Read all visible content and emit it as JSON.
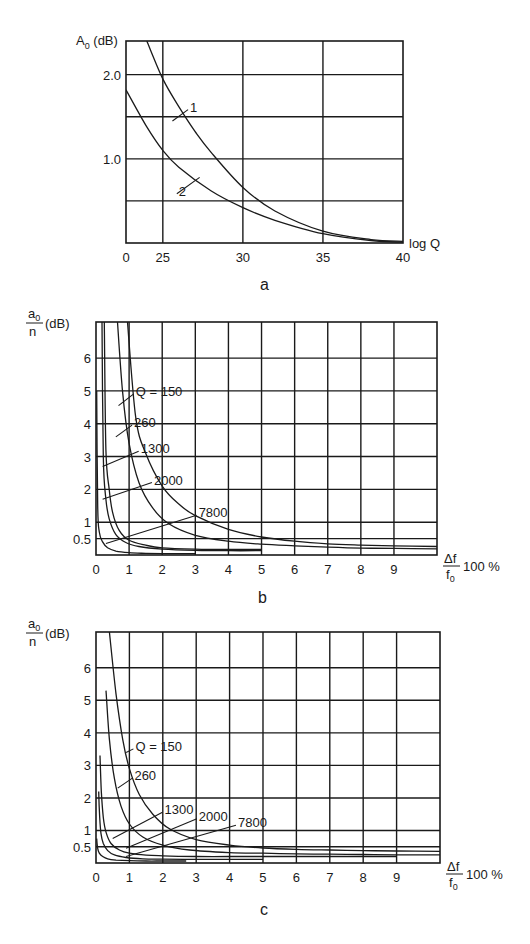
{
  "chart_data": [
    {
      "id": "a",
      "type": "line",
      "caption": "a",
      "ylabel": "A₀ (dB)",
      "ylabel_main": "A",
      "ylabel_sub": "0",
      "ylabel_unit": "(dB)",
      "xlabel": "log Q",
      "x_ticks": [
        {
          "value": 20,
          "label": "0"
        },
        {
          "value": 25,
          "label": "25"
        },
        {
          "value": 30,
          "label": "30"
        },
        {
          "value": 35,
          "label": "35"
        },
        {
          "value": 40,
          "label": "40"
        }
      ],
      "x_gridlines": [
        25,
        30,
        35
      ],
      "y_ticks": [
        {
          "value": 2.0,
          "label": "2.0"
        },
        {
          "value": 1.0,
          "label": "1.0"
        }
      ],
      "y_gridlines": [
        0.5,
        1.0,
        1.5,
        2.0
      ],
      "xlim": [
        22.7,
        40
      ],
      "ylim": [
        0,
        2.4
      ],
      "series": [
        {
          "name": "1",
          "x": [
            24.0,
            25.0,
            26.0,
            27.0,
            28.0,
            30.0,
            32.0,
            35.0,
            38.0,
            40.0
          ],
          "y": [
            2.4,
            1.95,
            1.62,
            1.33,
            1.08,
            0.66,
            0.38,
            0.14,
            0.04,
            0.02
          ]
        },
        {
          "name": "2",
          "x": [
            22.7,
            24.0,
            25.0,
            26.0,
            28.0,
            30.0,
            32.0,
            35.0,
            38.0,
            40.0
          ],
          "y": [
            1.82,
            1.38,
            1.1,
            0.9,
            0.62,
            0.42,
            0.27,
            0.11,
            0.03,
            0.01
          ]
        }
      ],
      "annotations": [
        {
          "text": "1",
          "x": 26.7,
          "y": 1.62,
          "tx": 25.6,
          "ty": 1.45
        },
        {
          "text": "2",
          "x": 26.0,
          "y": 0.62,
          "tx": 27.3,
          "ty": 0.78
        }
      ]
    },
    {
      "id": "b",
      "type": "line",
      "caption": "b",
      "ylabel_main": "a",
      "ylabel_sub": "0",
      "ylabel_den": "n",
      "ylabel_unit": "(dB)",
      "xlabel_num": "Δf",
      "xlabel_den_main": "f",
      "xlabel_den_sub": "0",
      "xlabel_suffix": "100 %",
      "x_ticks": [
        0,
        1,
        2,
        3,
        4,
        5,
        6,
        7,
        8,
        9
      ],
      "x_gridlines": [
        1,
        2,
        3,
        4,
        5,
        6,
        7,
        8,
        9
      ],
      "y_ticks": [
        {
          "value": 0.5,
          "label": "0.5"
        },
        {
          "value": 1,
          "label": "1"
        },
        {
          "value": 2,
          "label": "2"
        },
        {
          "value": 3,
          "label": "3"
        },
        {
          "value": 4,
          "label": "4"
        },
        {
          "value": 5,
          "label": "5"
        },
        {
          "value": 6,
          "label": "6"
        }
      ],
      "y_gridlines": [
        0.5,
        1,
        2,
        3,
        4,
        5,
        6
      ],
      "xlim": [
        0,
        10.3
      ],
      "ylim": [
        0,
        7.1
      ],
      "series": [
        {
          "name": "Q = 150",
          "x": [
            0.95,
            1.2,
            1.5,
            2.0,
            2.5,
            3.0,
            4.0,
            5.0,
            6.0,
            7.0,
            8.0,
            9.0,
            10.3
          ],
          "y": [
            7.1,
            4.2,
            3.1,
            2.1,
            1.55,
            1.2,
            0.78,
            0.55,
            0.42,
            0.34,
            0.3,
            0.28,
            0.26
          ]
        },
        {
          "name": "260",
          "x": [
            0.65,
            0.8,
            1.0,
            1.3,
            1.7,
            2.2,
            3.0,
            4.0,
            5.0,
            6.0,
            7.0,
            8.0,
            9.0,
            10.3
          ],
          "y": [
            7.1,
            5.0,
            3.4,
            2.2,
            1.45,
            0.95,
            0.6,
            0.42,
            0.33,
            0.28,
            0.24,
            0.21,
            0.2,
            0.19
          ]
        },
        {
          "name": "1300",
          "x": [
            0.25,
            0.3,
            0.4,
            0.5,
            0.7,
            1.0,
            1.5,
            2.0,
            3.0,
            4.0,
            5.0
          ],
          "y": [
            7.1,
            3.2,
            2.0,
            1.3,
            0.75,
            0.45,
            0.3,
            0.22,
            0.18,
            0.17,
            0.17
          ]
        },
        {
          "name": "2000",
          "x": [
            0.18,
            0.22,
            0.3,
            0.4,
            0.6,
            0.9,
            1.3,
            2.0,
            3.0,
            4.0,
            5.0
          ],
          "y": [
            7.1,
            3.0,
            1.7,
            1.1,
            0.62,
            0.38,
            0.26,
            0.18,
            0.14,
            0.13,
            0.13
          ]
        },
        {
          "name": "7800",
          "x": [
            0.02,
            0.05,
            0.1,
            0.2,
            0.35,
            0.6,
            1.0,
            1.5,
            2.0,
            2.5,
            3.0
          ],
          "y": [
            5.0,
            1.5,
            0.7,
            0.4,
            0.22,
            0.12,
            0.07,
            0.05,
            0.04,
            0.04,
            0.04
          ]
        }
      ],
      "annotations": [
        {
          "text": "Q = 150",
          "x": 1.2,
          "y": 5.0,
          "tx": 0.68,
          "ty": 4.55
        },
        {
          "text": "260",
          "x": 1.15,
          "y": 4.05,
          "tx": 0.6,
          "ty": 3.6
        },
        {
          "text": "1300",
          "x": 1.35,
          "y": 3.25,
          "tx": 0.2,
          "ty": 2.7
        },
        {
          "text": "2000",
          "x": 1.75,
          "y": 2.3,
          "tx": 0.2,
          "ty": 1.7
        },
        {
          "text": "7800",
          "x": 3.1,
          "y": 1.3,
          "tx": 0.3,
          "ty": 0.35
        }
      ]
    },
    {
      "id": "c",
      "type": "line",
      "caption": "c",
      "ylabel_main": "a",
      "ylabel_sub": "0",
      "ylabel_den": "n",
      "ylabel_unit": "(dB)",
      "xlabel_num": "Δf",
      "xlabel_den_main": "f",
      "xlabel_den_sub": "0",
      "xlabel_suffix": "100 %",
      "x_ticks": [
        0,
        1,
        2,
        3,
        4,
        5,
        6,
        7,
        8,
        9
      ],
      "x_gridlines": [
        1,
        2,
        3,
        4,
        5,
        6,
        7,
        8,
        9
      ],
      "y_ticks": [
        {
          "value": 0.5,
          "label": "0.5"
        },
        {
          "value": 1,
          "label": "1"
        },
        {
          "value": 2,
          "label": "2"
        },
        {
          "value": 3,
          "label": "3"
        },
        {
          "value": 4,
          "label": "4"
        },
        {
          "value": 5,
          "label": "5"
        },
        {
          "value": 6,
          "label": "6"
        }
      ],
      "y_gridlines": [
        0.5,
        1,
        2,
        3,
        4,
        5,
        6
      ],
      "xlim": [
        0,
        10.3
      ],
      "ylim": [
        0,
        7.1
      ],
      "series": [
        {
          "name": "Q = 150",
          "x": [
            0.4,
            0.6,
            0.8,
            1.0,
            1.3,
            1.7,
            2.2,
            3.0,
            4.0,
            5.0,
            6.0,
            7.0,
            8.0,
            9.0,
            10.3
          ],
          "y": [
            7.1,
            5.2,
            3.8,
            2.9,
            2.1,
            1.5,
            1.05,
            0.72,
            0.55,
            0.46,
            0.42,
            0.4,
            0.38,
            0.37,
            0.36
          ]
        },
        {
          "name": "260",
          "x": [
            0.3,
            0.4,
            0.55,
            0.75,
            1.0,
            1.4,
            2.0,
            2.8,
            4.0,
            5.0,
            6.0,
            7.0,
            8.0,
            9.0,
            10.3
          ],
          "y": [
            5.3,
            3.8,
            2.6,
            1.75,
            1.2,
            0.8,
            0.55,
            0.4,
            0.32,
            0.3,
            0.28,
            0.27,
            0.26,
            0.25,
            0.25
          ]
        },
        {
          "name": "1300",
          "x": [
            0.12,
            0.16,
            0.22,
            0.3,
            0.45,
            0.7,
            1.0,
            1.5,
            2.0,
            3.0,
            4.0,
            5.0,
            6.0,
            7.0,
            8.0,
            9.0
          ],
          "y": [
            3.3,
            2.2,
            1.4,
            0.95,
            0.6,
            0.4,
            0.3,
            0.24,
            0.22,
            0.2,
            0.2,
            0.2,
            0.2,
            0.2,
            0.2,
            0.2
          ]
        },
        {
          "name": "2000",
          "x": [
            0.08,
            0.11,
            0.15,
            0.22,
            0.35,
            0.55,
            0.9,
            1.4,
            2.0,
            3.0,
            4.0,
            5.0
          ],
          "y": [
            2.2,
            1.4,
            0.9,
            0.6,
            0.38,
            0.25,
            0.17,
            0.13,
            0.12,
            0.11,
            0.11,
            0.11
          ]
        },
        {
          "name": "7800",
          "x": [
            0.02,
            0.05,
            0.1,
            0.2,
            0.35,
            0.6,
            1.0,
            1.5,
            2.0,
            2.7
          ],
          "y": [
            0.75,
            0.45,
            0.3,
            0.2,
            0.13,
            0.09,
            0.07,
            0.06,
            0.06,
            0.06
          ]
        }
      ],
      "annotations": [
        {
          "text": "Q = 150",
          "x": 1.18,
          "y": 3.6,
          "tx": 0.9,
          "ty": 3.4
        },
        {
          "text": "260",
          "x": 1.15,
          "y": 2.7,
          "tx": 0.65,
          "ty": 2.3
        },
        {
          "text": "1300",
          "x": 2.05,
          "y": 1.65,
          "tx": 0.5,
          "ty": 0.75
        },
        {
          "text": "2000",
          "x": 3.08,
          "y": 1.45,
          "tx": 0.9,
          "ty": 0.45
        },
        {
          "text": "7800",
          "x": 4.25,
          "y": 1.25,
          "tx": 0.9,
          "ty": 0.2
        }
      ]
    }
  ]
}
